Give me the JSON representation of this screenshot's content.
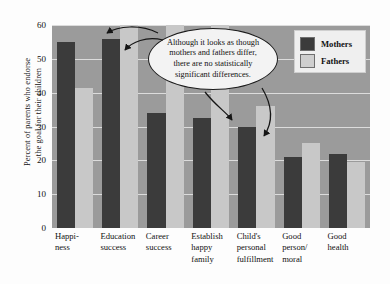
{
  "chart_data": {
    "type": "bar",
    "title": "",
    "xlabel": "",
    "ylabel": "Percent of parents who endorse the goal for their children",
    "ylim": [
      0,
      60
    ],
    "yticks": [
      0,
      10,
      20,
      30,
      40,
      50,
      60
    ],
    "grid": true,
    "legend_position": "top-right",
    "categories": [
      "Happiness",
      "Education success",
      "Career success",
      "Establish happy family",
      "Child's personal fulfillment",
      "Good person/moral",
      "Good health"
    ],
    "category_lines": [
      [
        "Happi-",
        "ness"
      ],
      [
        "Education",
        "success"
      ],
      [
        "Career",
        "success"
      ],
      [
        "Establish",
        "happy",
        "family"
      ],
      [
        "Child's",
        "personal",
        "fulfillment"
      ],
      [
        "Good",
        "person/",
        "moral"
      ],
      [
        "Good",
        "health"
      ]
    ],
    "series": [
      {
        "name": "Mothers",
        "color": "#3b3b3b",
        "values": [
          55,
          56,
          34,
          32.5,
          30,
          21,
          22
        ]
      },
      {
        "name": "Fathers",
        "color": "#c8c8c8",
        "values": [
          41.5,
          60,
          60,
          60,
          36,
          25,
          19.5
        ]
      }
    ],
    "annotations": [
      {
        "id": "callout",
        "lines": [
          "Although it looks as though",
          "mothers and fathers differ,",
          "there are no statistically",
          "significant differences."
        ]
      }
    ]
  },
  "legend": {
    "items": [
      {
        "label": "Mothers",
        "color": "#3b3b3b"
      },
      {
        "label": "Fathers",
        "color": "#cfcfcf"
      }
    ]
  },
  "axis": {
    "y_title_line1": "Percent of parents who endorse",
    "y_title_line2": "the goal for their children",
    "tick_60": "60",
    "tick_50": "50",
    "tick_40": "40",
    "tick_30": "30",
    "tick_20": "20",
    "tick_10": "10",
    "tick_0": "0"
  },
  "colors": {
    "plot_background": "#9b9b9b",
    "mothers": "#3b3b3b",
    "fathers": "#c8c8c8",
    "gridline": "#e8e8e8",
    "page": "#fdfdfd"
  }
}
